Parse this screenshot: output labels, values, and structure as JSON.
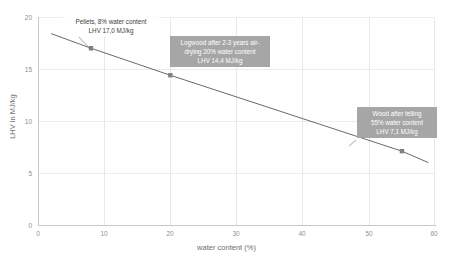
{
  "chart_data": {
    "type": "line",
    "title": "",
    "xlabel": "water content (%)",
    "ylabel": "LHV in MJ/kg",
    "xlim": [
      0,
      60
    ],
    "ylim": [
      0,
      20
    ],
    "xticks": [
      0,
      10,
      20,
      30,
      40,
      50,
      60
    ],
    "yticks": [
      0,
      5,
      10,
      15,
      20
    ],
    "grid": true,
    "legend": "none",
    "series": [
      {
        "name": "Lower heating value vs water content",
        "line_color": "#595959",
        "marker_color": "#808080",
        "x": [
          2,
          8,
          20,
          55,
          59
        ],
        "y": [
          18.4,
          17.0,
          14.4,
          7.1,
          6.0
        ],
        "markers_at": [
          {
            "x": 8,
            "y": 17.0
          },
          {
            "x": 20,
            "y": 14.4
          },
          {
            "x": 55,
            "y": 7.1
          }
        ]
      }
    ],
    "annotations": [
      {
        "id": "pellets",
        "style": "plain",
        "lines": [
          "Pellets, 8% water content",
          "LHV 17,0 MJ/kg"
        ],
        "points_to": {
          "x": 8,
          "y": 17.0
        }
      },
      {
        "id": "logwood",
        "style": "filled",
        "lines": [
          "Logwood after 2-3 years air-",
          "drying 20% water content",
          "LHV 14,4 MJ/kg"
        ],
        "points_to": {
          "x": 20,
          "y": 14.4
        }
      },
      {
        "id": "green-wood",
        "style": "filled",
        "lines": [
          "Wood after felling",
          "55% water content",
          "LHV 7,1 MJ/kg"
        ],
        "points_to": {
          "x": 55,
          "y": 7.1
        }
      }
    ]
  },
  "axes": {
    "x_title": "water content (%)",
    "y_title": "LHV in MJ/kg",
    "x_labels": [
      "0",
      "10",
      "20",
      "30",
      "40",
      "50",
      "60"
    ],
    "y_labels": [
      "0",
      "5",
      "10",
      "15",
      "20"
    ]
  },
  "annotations": {
    "pellets": {
      "line1": "Pellets, 8% water content",
      "line2": "LHV 17,0 MJ/kg"
    },
    "logwood": {
      "line1": "Logwood after 2-3 years air-",
      "line2": "drying 20% water content",
      "line3": "LHV 14,4 MJ/kg"
    },
    "green_wood": {
      "line1": "Wood after felling",
      "line2": "55% water content",
      "line3": "LHV 7,1 MJ/kg"
    }
  },
  "colors": {
    "line": "#595959",
    "marker": "#808080",
    "annotation_fill": "#a6a6a6",
    "annotation_text": "#ffffff",
    "grid": "#e8e8e8",
    "axis": "#c8c8c8",
    "tick_text": "#8f8f8f"
  }
}
